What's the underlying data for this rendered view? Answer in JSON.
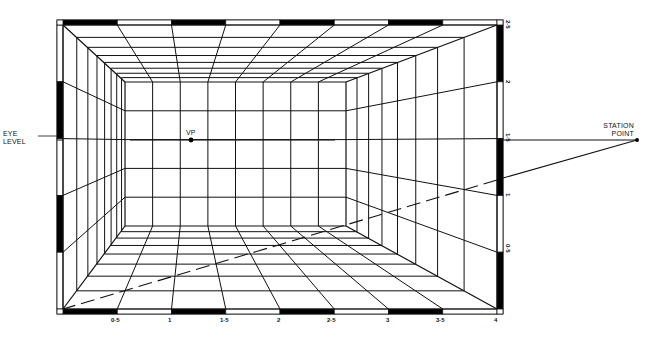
{
  "diagram": {
    "type": "one-point perspective room grid",
    "labels": {
      "eye_level": [
        "EYE",
        "LEVEL"
      ],
      "station_point": [
        "STATION",
        "POINT"
      ],
      "vanishing_point": "VP"
    },
    "bottom_scale": {
      "ticks": [
        "0·5",
        "1",
        "1·5",
        "2",
        "2·5",
        "3",
        "3·5",
        "4"
      ]
    },
    "right_scale": {
      "ticks": [
        "2·5",
        "2",
        "1·5",
        "1",
        "0·5"
      ]
    },
    "colors": {
      "line": "#111111",
      "background": "#ffffff",
      "scale_fill": "#000000"
    },
    "geometry": {
      "front_rect": [
        63,
        25,
        497,
        309
      ],
      "back_rect": [
        125,
        82,
        346,
        226
      ],
      "vp": [
        191,
        140
      ],
      "station_point": [
        637,
        140
      ],
      "eye_level_y": 140
    }
  }
}
